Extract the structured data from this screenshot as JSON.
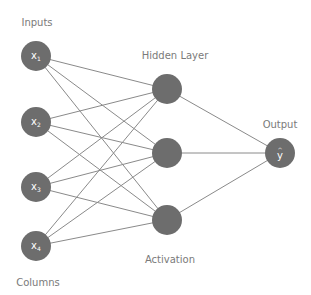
{
  "labels": {
    "inputs": "Inputs",
    "columns": "Columns",
    "hidden_layer": "Hidden Layer",
    "activation": "Activation",
    "output": "Output"
  },
  "input_nodes": [
    {
      "name": "x",
      "sub": "1",
      "cx": 36,
      "cy": 56
    },
    {
      "name": "x",
      "sub": "2",
      "cx": 36,
      "cy": 122
    },
    {
      "name": "x",
      "sub": "3",
      "cx": 36,
      "cy": 187
    },
    {
      "name": "x",
      "sub": "4",
      "cx": 36,
      "cy": 246
    }
  ],
  "hidden_nodes": [
    {
      "cx": 167,
      "cy": 89
    },
    {
      "cx": 167,
      "cy": 153
    },
    {
      "cx": 167,
      "cy": 220
    }
  ],
  "output_node": {
    "name": "y",
    "hat": "^",
    "cx": 280,
    "cy": 153
  },
  "colors": {
    "node_fill": "#6d6d6d",
    "edge": "#8a8a8a",
    "caption": "#7a7a7a",
    "background": "#ffffff"
  }
}
